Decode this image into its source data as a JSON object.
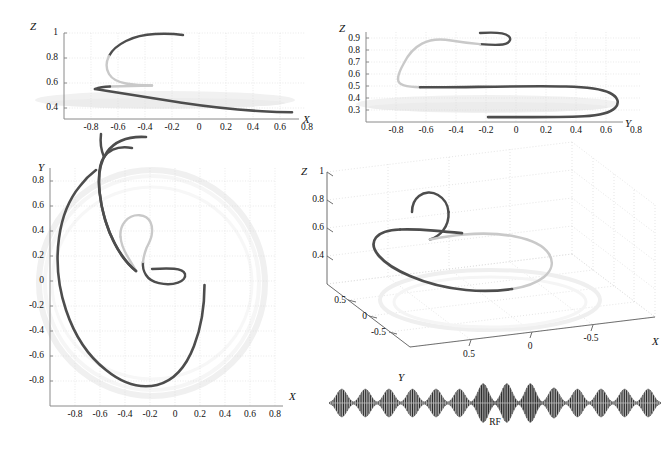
{
  "figure": {
    "title": "",
    "rf_caption": "RF",
    "colors": {
      "curve_dark": "#4d4d4d",
      "curve_light": "#c9c9c9",
      "axis": "#7a7a7a",
      "grid": "#d8d8d8",
      "text": "#111111",
      "sphere_ghost": "#eeeeee"
    }
  },
  "panels": [
    {
      "id": "panel-zx",
      "xlabel": "X",
      "ylabel": "Z",
      "xticks": [
        "-0.8",
        "-0.6",
        "-0.4",
        "-0.2",
        "0",
        "0.2",
        "0.4",
        "0.6",
        "0.8"
      ],
      "xtickvals": [
        -0.8,
        -0.6,
        -0.4,
        -0.2,
        0,
        0.2,
        0.4,
        0.6,
        0.8
      ],
      "yticks": [
        "1",
        "0.8",
        "0.6",
        "0.4"
      ],
      "ytickvals": [
        1,
        0.8,
        0.6,
        0.4
      ],
      "xlim": [
        -0.95,
        0.95
      ],
      "ylim": [
        0.3,
        1.04
      ]
    },
    {
      "id": "panel-zy",
      "xlabel": "Y",
      "ylabel": "Z",
      "xticks": [
        "-0.8",
        "-0.6",
        "-0.4",
        "-0.2",
        "0",
        "0.2",
        "0.4",
        "0.6",
        "0.8"
      ],
      "xtickvals": [
        -0.8,
        -0.6,
        -0.4,
        -0.2,
        0,
        0.2,
        0.4,
        0.6,
        0.8
      ],
      "yticks": [
        "0.9",
        "0.8",
        "0.7",
        "0.6",
        "0.5",
        "0.4",
        "0.3"
      ],
      "ytickvals": [
        0.9,
        0.8,
        0.7,
        0.6,
        0.5,
        0.4,
        0.3
      ],
      "xlim": [
        -0.95,
        0.95
      ],
      "ylim": [
        0.28,
        0.99
      ]
    },
    {
      "id": "panel-yx",
      "xlabel": "X",
      "ylabel": "Y",
      "xticks": [
        "-0.8",
        "-0.6",
        "-0.4",
        "-0.2",
        "0",
        "0.2",
        "0.4",
        "0.6",
        "0.8"
      ],
      "xtickvals": [
        -0.8,
        -0.6,
        -0.4,
        -0.2,
        0,
        0.2,
        0.4,
        0.6,
        0.8
      ],
      "yticks": [
        "0.8",
        "0.6",
        "0.4",
        "0.2",
        "0",
        "-0.2",
        "-0.4",
        "-0.6",
        "-0.8"
      ],
      "ytickvals": [
        0.8,
        0.6,
        0.4,
        0.2,
        0,
        -0.2,
        -0.4,
        -0.6,
        -0.8
      ],
      "xlim": [
        -0.98,
        0.98
      ],
      "ylim": [
        -0.98,
        0.98
      ]
    },
    {
      "id": "panel-3d",
      "xlabel": "X",
      "ylabel": "Y",
      "zlabel": "Z",
      "xticks": [
        "0.5",
        "0",
        "-0.5"
      ],
      "xtickvals": [
        0.5,
        0,
        -0.5
      ],
      "yticks": [
        "0.5",
        "0",
        "-0.5"
      ],
      "ytickvals": [
        0.5,
        0,
        -0.5
      ],
      "zticks": [
        "1",
        "0.8",
        "0.6",
        "0.4"
      ],
      "ztickvals": [
        1,
        0.8,
        0.6,
        0.4
      ]
    }
  ],
  "chart_data": {
    "type": "line",
    "title": "",
    "series": [
      {
        "name": "trajectory-dark-segment-1",
        "color": "#4d4d4d",
        "points_xyz": [
          [
            0.03,
            0.1,
            0.995
          ],
          [
            -0.02,
            0.13,
            0.993
          ],
          [
            -0.08,
            0.14,
            0.99
          ],
          [
            -0.14,
            0.14,
            0.986
          ],
          [
            -0.2,
            0.12,
            0.979
          ],
          [
            -0.26,
            0.09,
            0.969
          ],
          [
            -0.31,
            0.05,
            0.956
          ],
          [
            -0.345,
            0.0,
            0.94
          ],
          [
            -0.365,
            -0.05,
            0.922
          ]
        ]
      },
      {
        "name": "trajectory-light-segment",
        "color": "#c9c9c9",
        "points_xyz": [
          [
            -0.365,
            -0.05,
            0.922
          ],
          [
            -0.37,
            -0.12,
            0.9
          ],
          [
            -0.355,
            -0.2,
            0.872
          ],
          [
            -0.335,
            -0.29,
            0.84
          ],
          [
            -0.315,
            -0.37,
            0.805
          ],
          [
            -0.3,
            -0.45,
            0.772
          ],
          [
            -0.31,
            -0.52,
            0.742
          ],
          [
            -0.335,
            -0.565,
            0.718
          ],
          [
            -0.375,
            -0.59,
            0.703
          ],
          [
            -0.43,
            -0.595,
            0.697
          ],
          [
            -0.5,
            -0.585,
            0.693
          ],
          [
            -0.57,
            -0.56,
            0.692
          ],
          [
            -0.64,
            -0.525,
            0.693
          ],
          [
            -0.7,
            -0.49,
            0.695
          ]
        ]
      },
      {
        "name": "trajectory-dark-segment-2",
        "color": "#4d4d4d",
        "points_xyz": [
          [
            -0.7,
            -0.49,
            0.695
          ],
          [
            -0.74,
            -0.44,
            0.69
          ],
          [
            -0.77,
            -0.36,
            0.676
          ],
          [
            -0.79,
            -0.27,
            0.657
          ],
          [
            -0.8,
            -0.17,
            0.635
          ],
          [
            -0.795,
            -0.05,
            0.611
          ],
          [
            -0.775,
            0.07,
            0.588
          ],
          [
            -0.74,
            0.2,
            0.566
          ],
          [
            -0.69,
            0.33,
            0.545
          ],
          [
            -0.62,
            0.46,
            0.527
          ],
          [
            -0.53,
            0.58,
            0.51
          ],
          [
            -0.42,
            0.69,
            0.496
          ],
          [
            -0.3,
            0.77,
            0.484
          ],
          [
            -0.17,
            0.82,
            0.473
          ],
          [
            -0.03,
            0.845,
            0.465
          ],
          [
            0.11,
            0.845,
            0.458
          ],
          [
            0.25,
            0.82,
            0.453
          ],
          [
            0.39,
            0.77,
            0.449
          ],
          [
            0.52,
            0.69,
            0.447
          ],
          [
            0.64,
            0.58,
            0.445
          ],
          [
            0.74,
            0.45,
            0.444
          ],
          [
            0.82,
            0.31,
            0.443
          ],
          [
            0.87,
            0.16,
            0.443
          ],
          [
            0.895,
            0.0,
            0.443
          ],
          [
            0.89,
            -0.07,
            0.444
          ]
        ]
      }
    ],
    "projections": [
      {
        "name": "Z vs X",
        "xaxis": "X",
        "yaxis": "Z"
      },
      {
        "name": "Z vs Y",
        "xaxis": "Y",
        "yaxis": "Z"
      },
      {
        "name": "Y vs X",
        "xaxis": "X",
        "yaxis": "Y"
      }
    ],
    "rf_pulse_train": {
      "label": "RF",
      "n_packets": 14,
      "envelope": "gaussian",
      "amplitudes": [
        0.72,
        0.72,
        0.72,
        0.72,
        0.72,
        0.72,
        1.0,
        1.0,
        1.0,
        0.78,
        0.72,
        0.72,
        0.72,
        0.72
      ],
      "shades": [
        "#d5d5d5",
        "#d5d5d5",
        "#d5d5d5",
        "#d5d5d5",
        "#d5d5d5",
        "#d5d5d5",
        "#8c8c8c",
        "#9a9a9a",
        "#8c8c8c",
        "#c2c2c2",
        "#d5d5d5",
        "#d5d5d5",
        "#d5d5d5",
        "#d5d5d5"
      ]
    }
  }
}
